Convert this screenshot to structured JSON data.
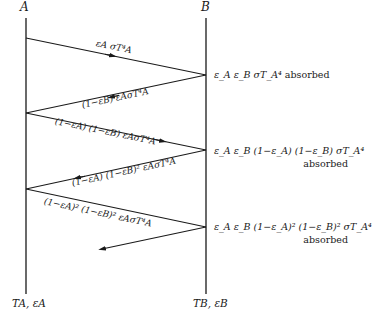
{
  "surfaces": {
    "a": {
      "top_label": "A",
      "bottom_label": "T_A, ε_A",
      "bottom_label_display": "TA, εA"
    },
    "b": {
      "top_label": "B",
      "bottom_label": "T_B, ε_B",
      "bottom_label_display": "TB, εB"
    }
  },
  "rays": [
    {
      "label": "ε_A σT_A⁴",
      "display": "εA σT⁴A",
      "direction": "A→B"
    },
    {
      "label": "(1−ε_B) ε_A σT_A⁴",
      "display": "(1−εB) εAσT⁴A",
      "direction": "B→A"
    },
    {
      "label": "(1−ε_A) (1−ε_B) ε_A σT_A⁴",
      "display": "(1−εA) (1−εB) εAσT⁴A",
      "direction": "A→B"
    },
    {
      "label": "(1−ε_A) (1−ε_B)² ε_A σT_A⁴",
      "display": "(1−εA) (1−εB)² εAσT⁴A",
      "direction": "B→A"
    },
    {
      "label": "(1−ε_A)² (1−ε_B)² ε_A σT_A⁴",
      "display": "(1−εA)² (1−εB)² εAσT⁴A",
      "direction": "A→B"
    },
    {
      "label": "",
      "display": "",
      "direction": "B→A"
    }
  ],
  "absorbed": [
    {
      "expr": "ε_A ε_B σT_A⁴",
      "suffix": "absorbed"
    },
    {
      "expr": "ε_A ε_B (1−ε_A) (1−ε_B) σT_A⁴",
      "suffix": "absorbed"
    },
    {
      "expr": "ε_A ε_B (1−ε_A)² (1−ε_B)² σT_A⁴",
      "suffix": "absorbed"
    }
  ],
  "colors": {
    "line": "#1a1a1a",
    "background": "#ffffff"
  }
}
